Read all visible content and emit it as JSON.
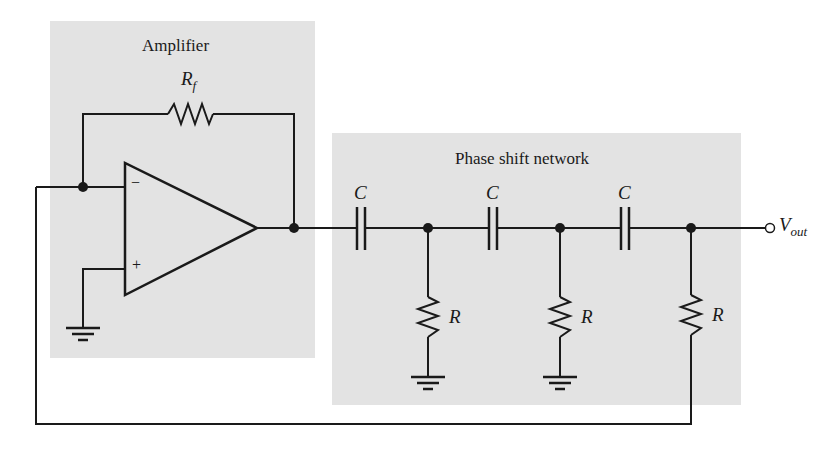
{
  "diagram": {
    "type": "RC phase-shift oscillator",
    "regions": {
      "amplifier": {
        "label": "Amplifier"
      },
      "phase_shift": {
        "label": "Phase shift network"
      }
    },
    "components": {
      "feedback_resistor": {
        "symbol": "R",
        "subscript": "f"
      },
      "capacitors": [
        {
          "label": "C"
        },
        {
          "label": "C"
        },
        {
          "label": "C"
        }
      ],
      "resistors": [
        {
          "label": "R"
        },
        {
          "label": "R"
        },
        {
          "label": "R"
        }
      ],
      "opamp": {
        "inverting": "−",
        "noninverting": "+"
      }
    },
    "output": {
      "symbol": "V",
      "subscript": "out"
    },
    "colors": {
      "shade": "#e3e3e3",
      "wire": "#1a1a1a",
      "background": "#ffffff"
    }
  }
}
